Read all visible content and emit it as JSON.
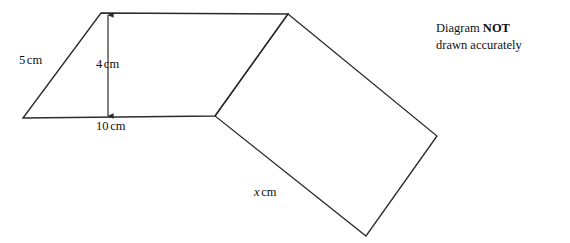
{
  "diagram": {
    "stroke_color": "#2b2b2b",
    "background_color": "#ffffff",
    "stroke_width": 1.3,
    "width": 570,
    "height": 243,
    "note": {
      "line1_prefix": "Diagram ",
      "line1_emphasis": "NOT",
      "line2": "drawn accurately"
    },
    "labels": {
      "slant_side": {
        "value": "5",
        "unit": "cm"
      },
      "height": {
        "value": "4",
        "unit": "cm"
      },
      "base": {
        "value": "10",
        "unit": "cm"
      },
      "unknown_side": {
        "value": "x",
        "unit": "cm"
      }
    },
    "shapes": {
      "parallelogram": {
        "name": "parallelogram",
        "points": "23,118 101,13 288,14 215,116",
        "vertices": [
          {
            "id": "A",
            "x": 23,
            "y": 118
          },
          {
            "id": "B",
            "x": 101,
            "y": 13
          },
          {
            "id": "C",
            "x": 288,
            "y": 14
          },
          {
            "id": "D",
            "x": 215,
            "y": 116
          }
        ]
      },
      "quadrilateral": {
        "name": "quadrilateral",
        "points": "288,14 437,136 366,236 215,116",
        "vertices": [
          {
            "id": "C",
            "x": 288,
            "y": 14
          },
          {
            "id": "E",
            "x": 437,
            "y": 136
          },
          {
            "id": "F",
            "x": 366,
            "y": 236
          },
          {
            "id": "D",
            "x": 215,
            "y": 116
          }
        ]
      }
    },
    "dimension_line": {
      "name": "height-dimension",
      "orientation": "vertical",
      "x": 108,
      "y_top": 15,
      "y_bottom": 116,
      "arrowheads": "both"
    }
  }
}
